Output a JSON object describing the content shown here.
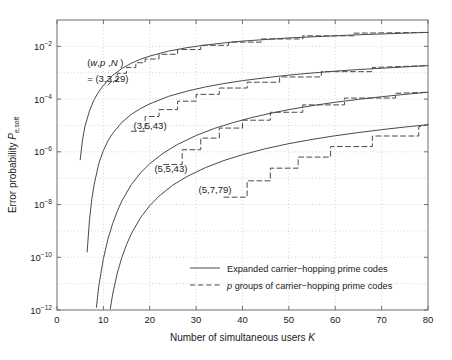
{
  "chart_data": {
    "type": "line",
    "title": "",
    "xlabel": "Number of simultaneous users",
    "xlabel_symbol": "K",
    "ylabel": "Error probability",
    "ylabel_symbol": "P",
    "ylabel_symbol_sub": "e,soft",
    "xlim": [
      0,
      80
    ],
    "ylim_exponents": [
      -12,
      -1
    ],
    "xticks": [
      0,
      10,
      20,
      30,
      40,
      50,
      60,
      70,
      80
    ],
    "yticks_exponents": [
      -2,
      -4,
      -6,
      -8,
      -10,
      -12
    ],
    "ytick_labels": [
      "10-2",
      "10-4",
      "10-6",
      "10-8",
      "10-10",
      "10-12"
    ],
    "grid": true,
    "grid_style": "dotted",
    "legend_position": "lower-right-inside",
    "legend": [
      {
        "label": "Expanded carrier−hopping prime codes",
        "style": "solid",
        "symbol": ""
      },
      {
        "label": "groups of carrier−hopping prime codes",
        "style": "dashed",
        "symbol": "p"
      }
    ],
    "annotations": [
      {
        "text": "(w,p ,N)",
        "x": 6.5,
        "y_exp": -2.75,
        "italic_parts": "w,p,N"
      },
      {
        "text": "= (3,3,29)",
        "x": 6.5,
        "y_exp": -3.35
      },
      {
        "text": "(3,5,43)",
        "x": 16.5,
        "y_exp": -5.15
      },
      {
        "text": "(5,5,43)",
        "x": 21.0,
        "y_exp": -6.75
      },
      {
        "text": "(5,7,79)",
        "x": 30.5,
        "y_exp": -7.55
      }
    ],
    "series": [
      {
        "name": "(3,3,29) expanded",
        "style": "solid",
        "points": [
          [
            5.0,
            -6.3
          ],
          [
            5.5,
            -5.55
          ],
          [
            6.0,
            -5.05
          ],
          [
            7.0,
            -4.45
          ],
          [
            8.0,
            -4.02
          ],
          [
            9.0,
            -3.72
          ],
          [
            10.0,
            -3.48
          ],
          [
            12.0,
            -3.1
          ],
          [
            14.0,
            -2.84
          ],
          [
            16.0,
            -2.64
          ],
          [
            18.0,
            -2.49
          ],
          [
            20.0,
            -2.37
          ],
          [
            24.0,
            -2.18
          ],
          [
            28.0,
            -2.05
          ],
          [
            32.0,
            -1.95
          ],
          [
            36.0,
            -1.87
          ],
          [
            40.0,
            -1.8
          ],
          [
            45.0,
            -1.74
          ],
          [
            50.0,
            -1.68
          ],
          [
            55.0,
            -1.64
          ],
          [
            60.0,
            -1.6
          ],
          [
            65.0,
            -1.56
          ],
          [
            70.0,
            -1.53
          ],
          [
            75.0,
            -1.5
          ],
          [
            80.0,
            -1.47
          ]
        ]
      },
      {
        "name": "(3,3,29) p groups",
        "style": "dashed",
        "points": [
          [
            11.0,
            -3.46
          ],
          [
            12.0,
            -3.3
          ],
          [
            13.0,
            -3.3
          ],
          [
            13.0,
            -3.02
          ],
          [
            15.0,
            -3.02
          ],
          [
            15.0,
            -2.8
          ],
          [
            17.0,
            -2.8
          ],
          [
            17.0,
            -2.62
          ],
          [
            19.0,
            -2.62
          ],
          [
            19.0,
            -2.48
          ],
          [
            22.0,
            -2.48
          ],
          [
            22.0,
            -2.3
          ],
          [
            26.0,
            -2.3
          ],
          [
            26.0,
            -2.12
          ],
          [
            31.0,
            -2.12
          ],
          [
            31.0,
            -1.96
          ],
          [
            37.0,
            -1.96
          ],
          [
            37.0,
            -1.84
          ],
          [
            44.0,
            -1.84
          ],
          [
            44.0,
            -1.72
          ],
          [
            53.0,
            -1.72
          ],
          [
            53.0,
            -1.6
          ],
          [
            64.0,
            -1.6
          ],
          [
            64.0,
            -1.5
          ],
          [
            80.0,
            -1.47
          ]
        ]
      },
      {
        "name": "(3,5,43) expanded",
        "style": "solid",
        "points": [
          [
            6.5,
            -9.8
          ],
          [
            7.0,
            -8.6
          ],
          [
            7.5,
            -7.8
          ],
          [
            8.0,
            -7.25
          ],
          [
            9.0,
            -6.45
          ],
          [
            10.0,
            -5.95
          ],
          [
            11.0,
            -5.58
          ],
          [
            12.0,
            -5.3
          ],
          [
            14.0,
            -4.88
          ],
          [
            16.0,
            -4.58
          ],
          [
            18.0,
            -4.36
          ],
          [
            20.0,
            -4.18
          ],
          [
            24.0,
            -3.9
          ],
          [
            28.0,
            -3.7
          ],
          [
            32.0,
            -3.54
          ],
          [
            36.0,
            -3.41
          ],
          [
            40.0,
            -3.3
          ],
          [
            45.0,
            -3.19
          ],
          [
            50.0,
            -3.09
          ],
          [
            55.0,
            -3.01
          ],
          [
            60.0,
            -2.94
          ],
          [
            65.0,
            -2.88
          ],
          [
            70.0,
            -2.83
          ],
          [
            75.0,
            -2.78
          ],
          [
            80.0,
            -2.73
          ]
        ]
      },
      {
        "name": "(3,5,43) p groups",
        "style": "dashed",
        "points": [
          [
            16.0,
            -5.22
          ],
          [
            19.0,
            -5.22
          ],
          [
            19.0,
            -4.66
          ],
          [
            22.0,
            -4.66
          ],
          [
            22.0,
            -4.4
          ],
          [
            26.0,
            -4.4
          ],
          [
            26.0,
            -4.08
          ],
          [
            30.0,
            -4.08
          ],
          [
            30.0,
            -3.82
          ],
          [
            35.0,
            -3.82
          ],
          [
            35.0,
            -3.58
          ],
          [
            41.0,
            -3.58
          ],
          [
            41.0,
            -3.36
          ],
          [
            48.0,
            -3.36
          ],
          [
            48.0,
            -3.16
          ],
          [
            57.0,
            -3.16
          ],
          [
            57.0,
            -2.96
          ],
          [
            68.0,
            -2.96
          ],
          [
            68.0,
            -2.8
          ],
          [
            80.0,
            -2.73
          ]
        ]
      },
      {
        "name": "(5,5,43) expanded",
        "style": "solid",
        "points": [
          [
            8.5,
            -11.9
          ],
          [
            9.0,
            -11.1
          ],
          [
            10.0,
            -10.05
          ],
          [
            11.0,
            -9.3
          ],
          [
            12.0,
            -8.72
          ],
          [
            13.0,
            -8.25
          ],
          [
            14.0,
            -7.86
          ],
          [
            16.0,
            -7.25
          ],
          [
            18.0,
            -6.8
          ],
          [
            20.0,
            -6.45
          ],
          [
            23.0,
            -6.04
          ],
          [
            26.0,
            -5.72
          ],
          [
            30.0,
            -5.38
          ],
          [
            34.0,
            -5.11
          ],
          [
            38.0,
            -4.89
          ],
          [
            42.0,
            -4.7
          ],
          [
            46.0,
            -4.54
          ],
          [
            50.0,
            -4.4
          ],
          [
            55.0,
            -4.25
          ],
          [
            60.0,
            -4.12
          ],
          [
            65.0,
            -4.01
          ],
          [
            70.0,
            -3.91
          ],
          [
            75.0,
            -3.82
          ],
          [
            80.0,
            -3.74
          ]
        ]
      },
      {
        "name": "(5,5,43) p groups",
        "style": "dashed",
        "points": [
          [
            23.0,
            -6.48
          ],
          [
            27.0,
            -6.48
          ],
          [
            27.0,
            -5.92
          ],
          [
            31.0,
            -5.92
          ],
          [
            31.0,
            -5.48
          ],
          [
            35.0,
            -5.48
          ],
          [
            35.0,
            -5.1
          ],
          [
            40.0,
            -5.1
          ],
          [
            40.0,
            -4.8
          ],
          [
            46.0,
            -4.8
          ],
          [
            46.0,
            -4.5
          ],
          [
            53.0,
            -4.5
          ],
          [
            53.0,
            -4.22
          ],
          [
            62.0,
            -4.22
          ],
          [
            62.0,
            -3.96
          ],
          [
            73.0,
            -3.96
          ],
          [
            73.0,
            -3.78
          ],
          [
            80.0,
            -3.74
          ]
        ]
      },
      {
        "name": "(5,7,79) expanded",
        "style": "solid",
        "points": [
          [
            11.5,
            -11.95
          ],
          [
            12.0,
            -11.4
          ],
          [
            13.0,
            -10.6
          ],
          [
            14.0,
            -10.0
          ],
          [
            15.0,
            -9.52
          ],
          [
            16.0,
            -9.12
          ],
          [
            18.0,
            -8.5
          ],
          [
            20.0,
            -8.04
          ],
          [
            22.0,
            -7.68
          ],
          [
            25.0,
            -7.26
          ],
          [
            28.0,
            -6.94
          ],
          [
            32.0,
            -6.6
          ],
          [
            36.0,
            -6.33
          ],
          [
            40.0,
            -6.11
          ],
          [
            45.0,
            -5.88
          ],
          [
            50.0,
            -5.69
          ],
          [
            55.0,
            -5.53
          ],
          [
            60.0,
            -5.39
          ],
          [
            65.0,
            -5.27
          ],
          [
            70.0,
            -5.16
          ],
          [
            75.0,
            -5.06
          ],
          [
            80.0,
            -4.97
          ]
        ]
      },
      {
        "name": "(5,7,79) p groups",
        "style": "dashed",
        "points": [
          [
            36.0,
            -7.72
          ],
          [
            41.0,
            -7.72
          ],
          [
            41.0,
            -7.1
          ],
          [
            46.0,
            -7.1
          ],
          [
            46.0,
            -6.62
          ],
          [
            52.0,
            -6.62
          ],
          [
            52.0,
            -6.2
          ],
          [
            59.0,
            -6.2
          ],
          [
            59.0,
            -5.8
          ],
          [
            68.0,
            -5.8
          ],
          [
            68.0,
            -5.4
          ],
          [
            78.0,
            -5.4
          ],
          [
            78.0,
            -5.05
          ],
          [
            80.0,
            -4.97
          ]
        ]
      }
    ]
  }
}
